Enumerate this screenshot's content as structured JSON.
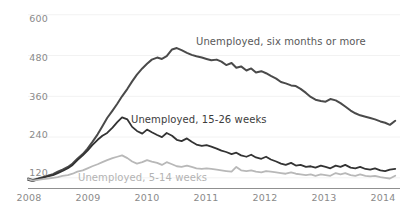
{
  "chart_data": {
    "type": "line",
    "title": "",
    "subtitle": "",
    "xlabel": "",
    "ylabel": "",
    "grid": "faint-horizontal",
    "legend_position": "inline-annotations",
    "xlim": [
      2008.0,
      2014.25
    ],
    "ylim": [
      90,
      620
    ],
    "yticks": [
      120,
      240,
      360,
      480,
      600
    ],
    "xticks": [
      2008,
      2009,
      2010,
      2011,
      2012,
      2013,
      2014
    ],
    "xtick_labels": [
      "2008",
      "2009",
      "2010",
      "2011",
      "2012",
      "2013",
      "2014"
    ],
    "ytick_labels": [
      "120",
      "240",
      "360",
      "480",
      "600"
    ],
    "units_note": "thousands of persons (monthly)",
    "series": [
      {
        "name": "Unemployed, six months or more",
        "color": "#4a4a4a",
        "width": 2.0,
        "label_x": 2011.05,
        "label_y": 520,
        "x": [
          2008.0,
          2008.08,
          2008.17,
          2008.25,
          2008.33,
          2008.42,
          2008.5,
          2008.58,
          2008.67,
          2008.75,
          2008.83,
          2008.92,
          2009.0,
          2009.08,
          2009.17,
          2009.25,
          2009.33,
          2009.42,
          2009.5,
          2009.58,
          2009.67,
          2009.75,
          2009.83,
          2009.92,
          2010.0,
          2010.08,
          2010.17,
          2010.25,
          2010.33,
          2010.42,
          2010.5,
          2010.58,
          2010.67,
          2010.75,
          2010.83,
          2010.92,
          2011.0,
          2011.08,
          2011.17,
          2011.25,
          2011.33,
          2011.42,
          2011.5,
          2011.58,
          2011.67,
          2011.75,
          2011.83,
          2011.92,
          2012.0,
          2012.08,
          2012.17,
          2012.25,
          2012.33,
          2012.42,
          2012.5,
          2012.58,
          2012.67,
          2012.75,
          2012.83,
          2012.92,
          2013.0,
          2013.08,
          2013.17,
          2013.25,
          2013.33,
          2013.42,
          2013.5,
          2013.58,
          2013.67,
          2013.75,
          2013.83,
          2013.92,
          2014.0,
          2014.08,
          2014.17
        ],
        "values": [
          118,
          114,
          118,
          122,
          126,
          131,
          138,
          144,
          152,
          162,
          176,
          190,
          206,
          225,
          248,
          272,
          296,
          318,
          338,
          360,
          382,
          404,
          424,
          442,
          456,
          468,
          474,
          470,
          478,
          498,
          502,
          496,
          488,
          482,
          478,
          474,
          470,
          466,
          468,
          462,
          452,
          458,
          444,
          448,
          436,
          442,
          430,
          434,
          428,
          420,
          412,
          402,
          398,
          392,
          390,
          382,
          370,
          358,
          350,
          346,
          344,
          352,
          348,
          340,
          330,
          318,
          310,
          304,
          300,
          296,
          292,
          286,
          282,
          276,
          288
        ]
      },
      {
        "name": "Unemployed, 15-26 weeks",
        "color": "#333333",
        "width": 1.8,
        "label_x": 2009.6,
        "label_y": 268,
        "x": [
          2008.0,
          2008.08,
          2008.17,
          2008.25,
          2008.33,
          2008.42,
          2008.5,
          2008.58,
          2008.67,
          2008.75,
          2008.83,
          2008.92,
          2009.0,
          2009.08,
          2009.17,
          2009.25,
          2009.33,
          2009.42,
          2009.5,
          2009.58,
          2009.67,
          2009.75,
          2009.83,
          2009.92,
          2010.0,
          2010.08,
          2010.17,
          2010.25,
          2010.33,
          2010.42,
          2010.5,
          2010.58,
          2010.67,
          2010.75,
          2010.83,
          2010.92,
          2011.0,
          2011.08,
          2011.17,
          2011.25,
          2011.33,
          2011.42,
          2011.5,
          2011.58,
          2011.67,
          2011.75,
          2011.83,
          2011.92,
          2012.0,
          2012.08,
          2012.17,
          2012.25,
          2012.33,
          2012.42,
          2012.5,
          2012.58,
          2012.67,
          2012.75,
          2012.83,
          2012.92,
          2013.0,
          2013.08,
          2013.17,
          2013.25,
          2013.33,
          2013.42,
          2013.5,
          2013.58,
          2013.67,
          2013.75,
          2013.83,
          2013.92,
          2014.0,
          2014.08,
          2014.17
        ],
        "values": [
          114,
          110,
          116,
          120,
          124,
          128,
          134,
          140,
          148,
          158,
          172,
          186,
          200,
          216,
          232,
          244,
          252,
          268,
          284,
          298,
          292,
          270,
          258,
          250,
          262,
          254,
          246,
          240,
          252,
          244,
          232,
          228,
          236,
          226,
          218,
          214,
          216,
          212,
          206,
          200,
          196,
          190,
          194,
          186,
          182,
          188,
          180,
          176,
          182,
          174,
          168,
          162,
          158,
          164,
          156,
          158,
          152,
          154,
          150,
          156,
          152,
          148,
          156,
          152,
          158,
          150,
          148,
          152,
          146,
          144,
          148,
          142,
          140,
          144,
          146
        ]
      },
      {
        "name": "Unemployed, 5-14 weeks",
        "color": "#b8b8b8",
        "width": 1.8,
        "label_x": 2008.9,
        "label_y": 104,
        "x": [
          2008.0,
          2008.08,
          2008.17,
          2008.25,
          2008.33,
          2008.42,
          2008.5,
          2008.58,
          2008.67,
          2008.75,
          2008.83,
          2008.92,
          2009.0,
          2009.08,
          2009.17,
          2009.25,
          2009.33,
          2009.42,
          2009.5,
          2009.58,
          2009.67,
          2009.75,
          2009.83,
          2009.92,
          2010.0,
          2010.08,
          2010.17,
          2010.25,
          2010.33,
          2010.42,
          2010.5,
          2010.58,
          2010.67,
          2010.75,
          2010.83,
          2010.92,
          2011.0,
          2011.08,
          2011.17,
          2011.25,
          2011.33,
          2011.42,
          2011.5,
          2011.58,
          2011.67,
          2011.75,
          2011.83,
          2011.92,
          2012.0,
          2012.08,
          2012.17,
          2012.25,
          2012.33,
          2012.42,
          2012.5,
          2012.58,
          2012.67,
          2012.75,
          2012.83,
          2012.92,
          2013.0,
          2013.08,
          2013.17,
          2013.25,
          2013.33,
          2013.42,
          2013.5,
          2013.58,
          2013.67,
          2013.75,
          2013.83,
          2013.92,
          2014.0,
          2014.08,
          2014.17
        ],
        "values": [
          116,
          112,
          114,
          116,
          118,
          120,
          122,
          126,
          128,
          132,
          138,
          142,
          148,
          154,
          160,
          166,
          172,
          178,
          182,
          186,
          178,
          168,
          162,
          166,
          172,
          168,
          164,
          158,
          166,
          160,
          154,
          152,
          156,
          152,
          148,
          146,
          148,
          146,
          144,
          142,
          140,
          138,
          152,
          142,
          140,
          142,
          138,
          136,
          140,
          138,
          136,
          134,
          132,
          136,
          132,
          130,
          128,
          130,
          126,
          130,
          128,
          126,
          134,
          130,
          134,
          128,
          126,
          130,
          126,
          124,
          126,
          122,
          120,
          118,
          126
        ]
      }
    ]
  },
  "axes": {
    "ytick_labels": [
      "600",
      "480",
      "360",
      "240",
      "120"
    ],
    "xtick_labels": [
      "2008",
      "2009",
      "2010",
      "2011",
      "2012",
      "2013",
      "2014"
    ]
  },
  "annotations": {
    "six_months": "Unemployed, six months or more",
    "fifteen_twentysix": "Unemployed, 15-26 weeks",
    "five_fourteen": "Unemployed, 5-14 weeks"
  },
  "colors": {
    "line_dark": "#4a4a4a",
    "line_mid": "#333333",
    "line_light": "#b8b8b8",
    "axis": "#909090",
    "tick_text": "#8a8a8a",
    "grid": "#f2f2f2",
    "background": "#ffffff"
  }
}
